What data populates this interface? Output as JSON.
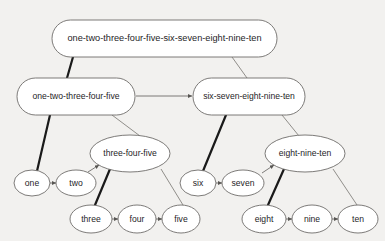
{
  "diagram": {
    "background_color": "#f2f1ef",
    "node_fill": "#ffffff",
    "node_stroke": "#6e6c6a",
    "thick_edge_color": "#1a1a1a",
    "thin_edge_color": "#84827e",
    "nodes": [
      {
        "id": "root",
        "label": "one-two-three-four-five-six-seven-eight-nine-ten",
        "shape": "stadium",
        "cx": 164.5,
        "cy": 38.5,
        "rx": 112.5,
        "ry": 18.5,
        "level": 1
      },
      {
        "id": "left5",
        "label": "one-two-three-four-five",
        "shape": "stadium",
        "cx": 76,
        "cy": 96.5,
        "rx": 59,
        "ry": 18.5,
        "level": 2
      },
      {
        "id": "right5",
        "label": "six-seven-eight-nine-ten",
        "shape": "stadium",
        "cx": 249,
        "cy": 96.5,
        "rx": 56,
        "ry": 18.5,
        "level": 2
      },
      {
        "id": "tfv",
        "label": "three-four-five",
        "shape": "ellipse",
        "cx": 130,
        "cy": 153.5,
        "rx": 40,
        "ry": 18.5,
        "level": 3
      },
      {
        "id": "ent",
        "label": "eight-nine-ten",
        "shape": "ellipse",
        "cx": 305,
        "cy": 153.5,
        "rx": 40,
        "ry": 18.5,
        "level": 3
      },
      {
        "id": "one",
        "label": "one",
        "shape": "ellipse",
        "cx": 32,
        "cy": 183,
        "rx": 18,
        "ry": 13,
        "level": 4
      },
      {
        "id": "two",
        "label": "two",
        "shape": "ellipse",
        "cx": 76,
        "cy": 183,
        "rx": 20,
        "ry": 13,
        "level": 4
      },
      {
        "id": "six",
        "label": "six",
        "shape": "ellipse",
        "cx": 198,
        "cy": 183,
        "rx": 18,
        "ry": 13,
        "level": 4
      },
      {
        "id": "seven",
        "label": "seven",
        "shape": "ellipse",
        "cx": 243,
        "cy": 183,
        "rx": 21,
        "ry": 13,
        "level": 4
      },
      {
        "id": "three",
        "label": "three",
        "shape": "ellipse",
        "cx": 91,
        "cy": 219,
        "rx": 21,
        "ry": 14,
        "level": 5
      },
      {
        "id": "four",
        "label": "four",
        "shape": "ellipse",
        "cx": 137,
        "cy": 219,
        "rx": 19,
        "ry": 14,
        "level": 5
      },
      {
        "id": "five",
        "label": "five",
        "shape": "ellipse",
        "cx": 181,
        "cy": 219,
        "rx": 19,
        "ry": 14,
        "level": 5
      },
      {
        "id": "eight",
        "label": "eight",
        "shape": "ellipse",
        "cx": 264,
        "cy": 219,
        "rx": 22,
        "ry": 14,
        "level": 5
      },
      {
        "id": "nine",
        "label": "nine",
        "shape": "ellipse",
        "cx": 312,
        "cy": 219,
        "rx": 20,
        "ry": 14,
        "level": 5
      },
      {
        "id": "ten",
        "label": "ten",
        "shape": "ellipse",
        "cx": 358,
        "cy": 219,
        "rx": 20,
        "ry": 14,
        "level": 5
      }
    ],
    "edges": [
      {
        "from": "root",
        "to": "left5",
        "style": "thick",
        "arrow": false,
        "x1": 73,
        "y1": 57,
        "x2": 67,
        "y2": 78
      },
      {
        "from": "root",
        "to": "right5",
        "style": "thin",
        "arrow": false,
        "x1": 232,
        "y1": 57,
        "x2": 247,
        "y2": 78
      },
      {
        "from": "left5",
        "to": "right5",
        "style": "thin",
        "arrow": true,
        "x1": 136,
        "y1": 96,
        "x2": 192,
        "y2": 96
      },
      {
        "from": "left5",
        "to": "one",
        "style": "thick",
        "arrow": false,
        "x1": 50,
        "y1": 115,
        "x2": 37,
        "y2": 171
      },
      {
        "from": "left5",
        "to": "tfv",
        "style": "thin",
        "arrow": false,
        "x1": 112,
        "y1": 115,
        "x2": 140,
        "y2": 136
      },
      {
        "from": "one",
        "to": "two",
        "style": "thin",
        "arrow": true,
        "x1": 50,
        "y1": 183,
        "x2": 56,
        "y2": 183
      },
      {
        "from": "two",
        "to": "tfv",
        "style": "thin",
        "arrow": true,
        "x1": 88,
        "y1": 172,
        "x2": 99,
        "y2": 165
      },
      {
        "from": "tfv",
        "to": "three",
        "style": "thick",
        "arrow": false,
        "x1": 110,
        "y1": 169,
        "x2": 95,
        "y2": 205
      },
      {
        "from": "tfv",
        "to": "five",
        "style": "thin",
        "arrow": false,
        "x1": 161,
        "y1": 169,
        "x2": 183,
        "y2": 205
      },
      {
        "from": "three",
        "to": "four",
        "style": "thin",
        "arrow": true,
        "x1": 112,
        "y1": 219,
        "x2": 118,
        "y2": 219
      },
      {
        "from": "four",
        "to": "five",
        "style": "thin",
        "arrow": true,
        "x1": 156,
        "y1": 219,
        "x2": 162,
        "y2": 219
      },
      {
        "from": "right5",
        "to": "six",
        "style": "thick",
        "arrow": false,
        "x1": 226,
        "y1": 115,
        "x2": 203,
        "y2": 171
      },
      {
        "from": "right5",
        "to": "ent",
        "style": "thin",
        "arrow": false,
        "x1": 282,
        "y1": 115,
        "x2": 299,
        "y2": 136
      },
      {
        "from": "six",
        "to": "seven",
        "style": "thin",
        "arrow": true,
        "x1": 216,
        "y1": 183,
        "x2": 222,
        "y2": 183
      },
      {
        "from": "seven",
        "to": "ent",
        "style": "thin",
        "arrow": true,
        "x1": 262,
        "y1": 173,
        "x2": 274,
        "y2": 165
      },
      {
        "from": "ent",
        "to": "eight",
        "style": "thick",
        "arrow": false,
        "x1": 284,
        "y1": 169,
        "x2": 268,
        "y2": 205
      },
      {
        "from": "ent",
        "to": "ten",
        "style": "thin",
        "arrow": false,
        "x1": 333,
        "y1": 169,
        "x2": 357,
        "y2": 205
      },
      {
        "from": "eight",
        "to": "nine",
        "style": "thin",
        "arrow": true,
        "x1": 286,
        "y1": 219,
        "x2": 292,
        "y2": 219
      },
      {
        "from": "nine",
        "to": "ten",
        "style": "thin",
        "arrow": true,
        "x1": 332,
        "y1": 219,
        "x2": 338,
        "y2": 219
      }
    ]
  }
}
